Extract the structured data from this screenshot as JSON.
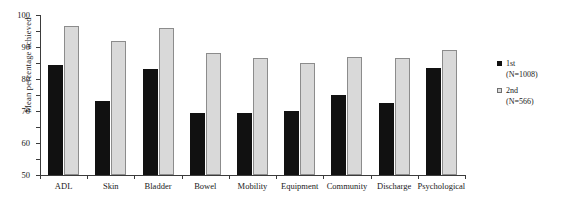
{
  "chart_data": {
    "type": "bar",
    "title": "",
    "xlabel": "",
    "ylabel": "Mean percentage achieved",
    "ylim": [
      0,
      100
    ],
    "ytick_step": 10,
    "yticks": [
      0,
      10,
      20,
      30,
      40,
      50,
      60,
      70,
      80,
      90,
      100
    ],
    "grid": false,
    "legend_position": "right",
    "categories": [
      "ADL",
      "Skin",
      "Bladder",
      "Bowel",
      "Mobility",
      "Equipment",
      "Community",
      "Discharge",
      "Psychological"
    ],
    "series": [
      {
        "name": "1st",
        "subtitle": "(N=1008)",
        "color": "#111111",
        "values": [
          69,
          46,
          66,
          39,
          39,
          40,
          50,
          45,
          67
        ]
      },
      {
        "name": "2nd",
        "subtitle": "(N=566)",
        "color": "#d9d9d9",
        "values": [
          93,
          84,
          92,
          76,
          73,
          70,
          74,
          73,
          78
        ]
      }
    ]
  },
  "legend": {
    "entries": [
      {
        "label": "1st",
        "sub": "(N=1008)"
      },
      {
        "label": "2nd",
        "sub": "(N=566)"
      }
    ]
  },
  "colors": {
    "series_1st": "#111111",
    "series_2nd": "#d9d9d9",
    "series_2nd_border": "#8c8c8c",
    "axis": "#3b3b3b",
    "text": "#1a1a1a",
    "background": "#ffffff"
  }
}
